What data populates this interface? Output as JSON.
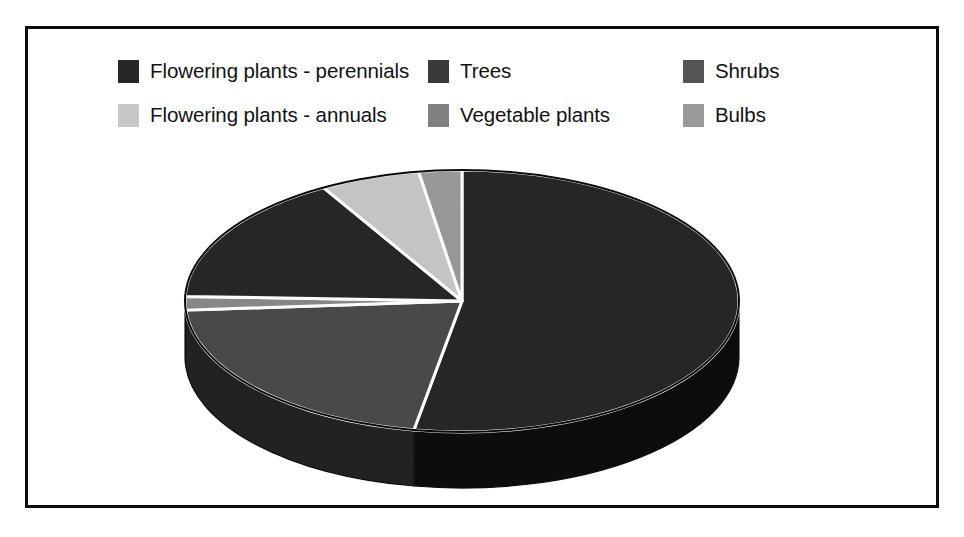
{
  "page": {
    "top_clipped_text": "— — — — — — — — — — — — —",
    "background_color": "#ffffff",
    "frame_border_color": "#0b0b0b"
  },
  "legend": {
    "rows": [
      {
        "items": [
          {
            "label": "Flowering plants - perennials",
            "color": "#262626",
            "swatch_name": "legend-swatch-perennials"
          },
          {
            "label": "Trees",
            "color": "#3a3a3a",
            "swatch_name": "legend-swatch-trees"
          },
          {
            "label": "Shrubs",
            "color": "#555555",
            "swatch_name": "legend-swatch-shrubs"
          }
        ]
      },
      {
        "items": [
          {
            "label": "Flowering plants - annuals",
            "color": "#c8c8c8",
            "swatch_name": "legend-swatch-annuals"
          },
          {
            "label": "Vegetable plants",
            "color": "#808080",
            "swatch_name": "legend-swatch-vegetable"
          },
          {
            "label": "Bulbs",
            "color": "#9a9a9a",
            "swatch_name": "legend-swatch-bulbs"
          }
        ]
      }
    ]
  },
  "chart_data": {
    "type": "pie",
    "title": "",
    "subtitle": "",
    "xlabel": "",
    "ylabel": "",
    "grid": false,
    "legend_position": "top",
    "three_d": true,
    "start_angle_deg": 0,
    "direction": "clockwise",
    "labels": [
      "Flowering plants - perennials",
      "Trees",
      "Vegetable plants",
      "Shrubs",
      "Flowering plants - annuals",
      "Bulbs"
    ],
    "values": [
      52.8,
      21.1,
      1.7,
      16.1,
      5.8,
      2.5
    ],
    "units": "percent",
    "colors": [
      "#262626",
      "#4a4a4a",
      "#8a8a8a",
      "#262626",
      "#c8c8c8",
      "#9a9a9a"
    ],
    "slices": [
      {
        "label": "Flowering plants - perennials",
        "value": 52.8,
        "color": "#262626",
        "side_color": "#0a0a0a",
        "start_deg": 0,
        "end_deg": 190.0
      },
      {
        "label": "Trees",
        "value": 21.1,
        "color": "#4a4a4a",
        "side_color": "#242424",
        "start_deg": 190.0,
        "end_deg": 266.0
      },
      {
        "label": "Vegetable plants",
        "value": 1.7,
        "color": "#8a8a8a",
        "side_color": "#4a4a4a",
        "start_deg": 266.0,
        "end_deg": 272.0
      },
      {
        "label": "Shrubs",
        "value": 16.1,
        "color": "#262626",
        "side_color": "#141414",
        "start_deg": 272.0,
        "end_deg": 330.0
      },
      {
        "label": "Flowering plants - annuals",
        "value": 5.8,
        "color": "#c8c8c8",
        "side_color": "#8a8a8a",
        "start_deg": 330.0,
        "end_deg": 351.0
      },
      {
        "label": "Bulbs",
        "value": 2.5,
        "color": "#9a9a9a",
        "side_color": "#5a5a5a",
        "start_deg": 351.0,
        "end_deg": 360.0
      }
    ],
    "geometry": {
      "center_x": 434,
      "center_y": 272,
      "radius_x": 277,
      "radius_y": 131,
      "depth": 56,
      "edge_color": "#ffffff",
      "outline_color": "#0b0b0b"
    }
  }
}
